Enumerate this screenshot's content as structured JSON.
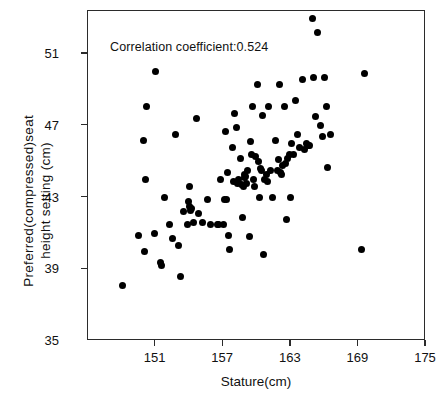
{
  "chart_data": {
    "type": "scatter",
    "title": "",
    "xlabel": "Stature(cm)",
    "ylabel": "Preferred(compressed)seat\nheight setting (cm)",
    "ylabel_lines": [
      "Preferred(compressed)seat",
      "height setting (cm)"
    ],
    "xlim": [
      145,
      175
    ],
    "ylim": [
      35,
      53.4
    ],
    "xticks": [
      151,
      157,
      163,
      169,
      175
    ],
    "yticks": [
      35,
      39,
      43,
      47,
      51
    ],
    "xticklabels": [
      "151",
      "157",
      "163",
      "169",
      "175"
    ],
    "yticklabels": [
      "35",
      "39",
      "43",
      "47",
      "51"
    ],
    "grid": false,
    "legend": null,
    "marker": "filled-circle",
    "marker_color": "#000000",
    "annotations": [
      {
        "text": "Correlation coefficient:0.524",
        "x": 147.0,
        "y": 51.8
      }
    ],
    "correlation_coefficient": 0.524,
    "n_points": 111,
    "points": [
      [
        148.1,
        38.1
      ],
      [
        149.5,
        40.9
      ],
      [
        149.9,
        46.2
      ],
      [
        150.0,
        40.0
      ],
      [
        150.1,
        44.0
      ],
      [
        150.2,
        48.1
      ],
      [
        150.9,
        41.0
      ],
      [
        151.0,
        50.0
      ],
      [
        151.4,
        39.4
      ],
      [
        151.5,
        39.2
      ],
      [
        151.8,
        43.0
      ],
      [
        152.2,
        41.5
      ],
      [
        152.5,
        40.7
      ],
      [
        152.8,
        46.5
      ],
      [
        153.0,
        40.3
      ],
      [
        153.2,
        38.6
      ],
      [
        153.5,
        42.2
      ],
      [
        153.8,
        41.5
      ],
      [
        153.9,
        42.8
      ],
      [
        154.0,
        42.5
      ],
      [
        154.0,
        43.6
      ],
      [
        154.1,
        42.3
      ],
      [
        154.2,
        42.4
      ],
      [
        154.4,
        41.6
      ],
      [
        154.6,
        47.4
      ],
      [
        154.8,
        42.1
      ],
      [
        155.2,
        41.6
      ],
      [
        155.6,
        42.9
      ],
      [
        155.9,
        41.5
      ],
      [
        156.5,
        41.5
      ],
      [
        156.6,
        41.5
      ],
      [
        156.8,
        44.0
      ],
      [
        157.0,
        41.5
      ],
      [
        157.1,
        42.9
      ],
      [
        157.2,
        46.7
      ],
      [
        157.3,
        42.9
      ],
      [
        157.4,
        44.4
      ],
      [
        157.5,
        40.9
      ],
      [
        157.6,
        40.1
      ],
      [
        157.8,
        45.8
      ],
      [
        157.9,
        43.9
      ],
      [
        158.0,
        47.7
      ],
      [
        158.2,
        46.9
      ],
      [
        158.3,
        43.8
      ],
      [
        158.4,
        44.0
      ],
      [
        158.5,
        45.2
      ],
      [
        158.6,
        43.7
      ],
      [
        158.7,
        41.9
      ],
      [
        158.8,
        43.6
      ],
      [
        158.9,
        44.3
      ],
      [
        158.9,
        44.1
      ],
      [
        159.0,
        44.2
      ],
      [
        159.1,
        43.8
      ],
      [
        159.2,
        44.5
      ],
      [
        159.3,
        40.8
      ],
      [
        159.4,
        46.1
      ],
      [
        159.5,
        45.4
      ],
      [
        159.6,
        48.1
      ],
      [
        159.7,
        44.0
      ],
      [
        159.8,
        43.6
      ],
      [
        159.9,
        45.3
      ],
      [
        160.0,
        49.3
      ],
      [
        160.1,
        45.0
      ],
      [
        160.2,
        43.0
      ],
      [
        160.3,
        44.6
      ],
      [
        160.4,
        44.5
      ],
      [
        160.5,
        47.6
      ],
      [
        160.6,
        39.8
      ],
      [
        160.7,
        44.0
      ],
      [
        160.8,
        44.3
      ],
      [
        160.9,
        43.9
      ],
      [
        161.0,
        48.1
      ],
      [
        161.2,
        44.5
      ],
      [
        161.4,
        43.0
      ],
      [
        161.6,
        46.2
      ],
      [
        161.8,
        44.5
      ],
      [
        161.9,
        45.1
      ],
      [
        162.0,
        49.3
      ],
      [
        162.1,
        44.4
      ],
      [
        162.2,
        44.3
      ],
      [
        162.3,
        44.8
      ],
      [
        162.4,
        48.1
      ],
      [
        162.5,
        44.9
      ],
      [
        162.6,
        41.8
      ],
      [
        162.7,
        45.2
      ],
      [
        162.9,
        45.4
      ],
      [
        163.0,
        43.0
      ],
      [
        163.1,
        46.0
      ],
      [
        163.2,
        45.4
      ],
      [
        163.4,
        48.4
      ],
      [
        163.6,
        46.5
      ],
      [
        163.8,
        45.8
      ],
      [
        164.0,
        49.6
      ],
      [
        164.2,
        45.7
      ],
      [
        164.4,
        46.0
      ],
      [
        164.6,
        45.9
      ],
      [
        164.7,
        45.9
      ],
      [
        164.9,
        53.0
      ],
      [
        165.0,
        49.7
      ],
      [
        165.2,
        47.5
      ],
      [
        165.4,
        52.2
      ],
      [
        165.6,
        47.0
      ],
      [
        165.8,
        46.4
      ],
      [
        166.0,
        49.7
      ],
      [
        166.2,
        48.1
      ],
      [
        166.3,
        44.7
      ],
      [
        166.5,
        46.5
      ],
      [
        169.3,
        40.1
      ],
      [
        169.5,
        49.9
      ]
    ]
  }
}
